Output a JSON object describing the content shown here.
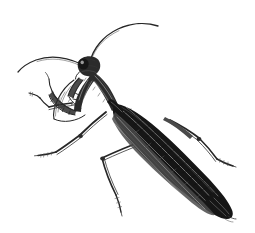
{
  "artwork": {
    "title": "Praying Mantis",
    "subject": "praying-mantis",
    "style": "vintage steel engraving line illustration",
    "medium": "black ink line art on white ground",
    "orientation": "facing upper-left, body angled down to lower-right",
    "background_color": "#ffffff",
    "ink_color": "#262626",
    "shadow_color": "#161616",
    "midtone_color": "#4a4a4a",
    "highlight_color": "#8c8c8c",
    "canvas": {
      "width": 255,
      "height": 233
    },
    "parts": [
      {
        "name": "left-antenna",
        "label": "Left antenna",
        "description": "long thin filament arcing from head up and to the left, tapering to a fine point"
      },
      {
        "name": "right-antenna",
        "label": "Right antenna",
        "description": "long thin filament arcing from head up and to the upper right, tapering to a fine point"
      },
      {
        "name": "head",
        "label": "Head",
        "description": "small triangular head with large compound eye, tilted toward upper left"
      },
      {
        "name": "compound-eye",
        "label": "Compound eye",
        "description": "rounded bulbous eye on the upper left of the head"
      },
      {
        "name": "prothorax",
        "label": "Prothorax",
        "description": "narrow elongated neck segment connecting head to thorax"
      },
      {
        "name": "raptorial-foreleg-near",
        "label": "Near raptorial foreleg",
        "description": "folded grasping front leg with spined femur and tibia, held up beneath the head"
      },
      {
        "name": "raptorial-foreleg-far",
        "label": "Far raptorial foreleg",
        "description": "second folded grasping front leg partly hidden behind the near one"
      },
      {
        "name": "middle-leg",
        "label": "Middle leg",
        "description": "slender walking leg angling down and to the left, ending in a segmented tarsus"
      },
      {
        "name": "hind-leg-near",
        "label": "Near hind leg",
        "description": "long walking leg bent at the knee, running down and to the left with a segmented foot"
      },
      {
        "name": "hind-leg-far",
        "label": "Far hind leg",
        "description": "long walking leg bent sharply at the knee, running down and to the right with a segmented foot"
      },
      {
        "name": "forewing",
        "label": "Forewing (tegmen)",
        "description": "long dark heavily hatched wing covering the abdomen, rounded at the tip"
      },
      {
        "name": "abdomen",
        "label": "Abdomen",
        "description": "tapered body beneath the folded wings, shaded with dense parallel strokes"
      }
    ]
  }
}
